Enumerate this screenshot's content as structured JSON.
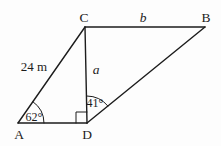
{
  "figure": {
    "vertex_labels": {
      "A": "A",
      "B": "B",
      "C": "C",
      "D": "D"
    },
    "side_labels": {
      "AC": "24 m",
      "CD": "a",
      "CB": "b"
    },
    "angle_labels": {
      "at_A": "62°",
      "at_D": "41°"
    },
    "colors": {
      "line": "#1c1c1c",
      "background": "#fdfdfd"
    }
  }
}
